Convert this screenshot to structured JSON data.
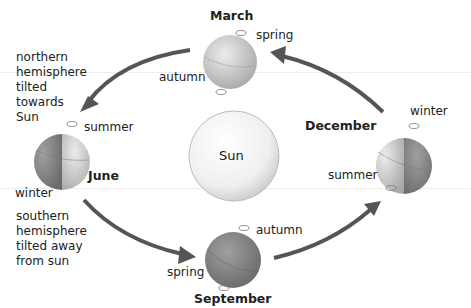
{
  "diagram": {
    "title": "",
    "center": {
      "label": "Sun"
    },
    "globes": [
      {
        "month": "March",
        "top_label": "spring",
        "bottom_label": "autumn"
      },
      {
        "month": "June",
        "top_label": "summer",
        "bottom_label": "winter"
      },
      {
        "month": "September",
        "top_label": "autumn",
        "bottom_label": "spring"
      },
      {
        "month": "December",
        "top_label": "winter",
        "bottom_label": "summer"
      }
    ],
    "notes": {
      "northern": "northern\nhemisphere\ntilted\ntowards\nSun",
      "southern": "southern\nhemisphere\ntilted away\nfrom sun"
    },
    "arrows": [
      {
        "from": "March",
        "to": "June"
      },
      {
        "from": "June",
        "to": "September"
      },
      {
        "from": "September",
        "to": "December"
      },
      {
        "from": "December",
        "to": "March"
      }
    ],
    "colors": {
      "arrow": "#555555",
      "globe_light": "#d9d9d9",
      "globe_dark": "#8c8c8c",
      "sun": "#f2f2f2"
    }
  }
}
